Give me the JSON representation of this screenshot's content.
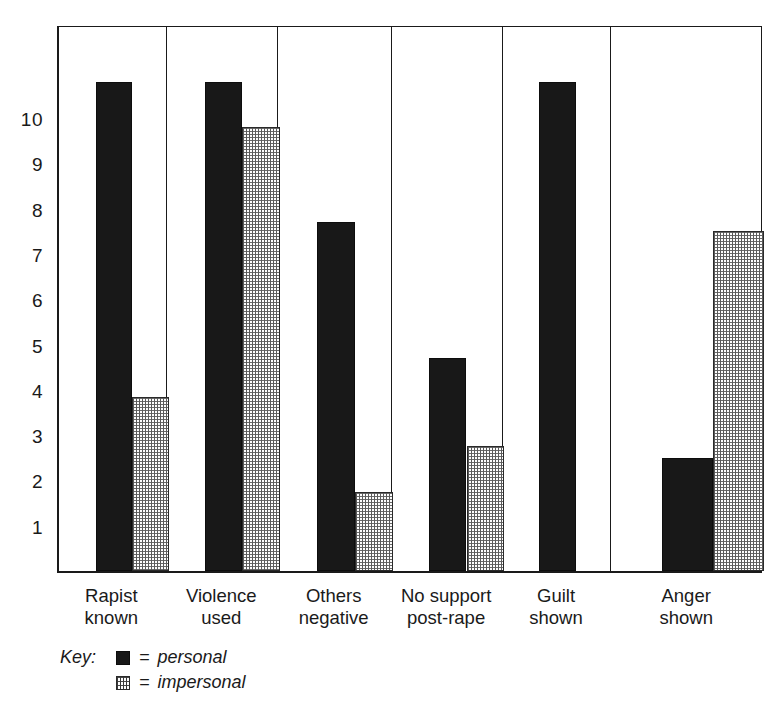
{
  "chart_data": {
    "type": "bar",
    "title": "",
    "subtitle": "",
    "xlabel": "",
    "ylabel": "",
    "ylim": [
      0,
      11.5
    ],
    "grid": false,
    "legend_position": "below-left",
    "categories": [
      "Rapist\nknown",
      "Violence\nused",
      "Others\nnegative",
      "No support\npost-rape",
      "Guilt\nshown",
      "Anger\nshown"
    ],
    "yticks": [
      10,
      9,
      8,
      7,
      6,
      5,
      4,
      3,
      2,
      1
    ],
    "series": [
      {
        "name": "personal",
        "values": [
          10.8,
          10.8,
          7.7,
          4.7,
          10.8,
          2.5
        ]
      },
      {
        "name": "impersonal",
        "values": [
          3.85,
          9.8,
          1.75,
          2.75,
          0,
          7.5
        ]
      }
    ],
    "legend": [
      {
        "key": "Key:",
        "symbol": "personal-swatch",
        "eq": "=",
        "label": "personal"
      },
      {
        "key": "",
        "symbol": "impersonal-swatch",
        "eq": "=",
        "label": "impersonal"
      }
    ],
    "colors": {
      "personal": "#181818",
      "impersonal": "#fdfdfd",
      "axis": "#1a1a1a",
      "background": "#ffffff"
    }
  }
}
